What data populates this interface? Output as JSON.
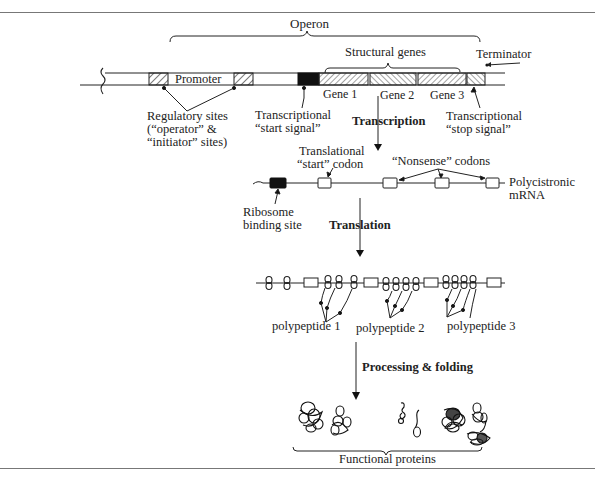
{
  "dna": {
    "operon_label": "Operon",
    "structural_genes_label": "Structural genes",
    "terminator_label": "Terminator",
    "promoter_label": "Promoter",
    "genes": [
      "Gene 1",
      "Gene 2",
      "Gene 3"
    ],
    "regulatory_sites_label": [
      "Regulatory sites",
      "(“operator” &",
      "“initiator” sites)"
    ],
    "transcriptional_start_label": [
      "Transcriptional",
      "“start signal”"
    ],
    "transcriptional_stop_label": [
      "Transcriptional",
      "“stop signal”"
    ]
  },
  "steps": {
    "transcription": "Transcription",
    "translation": "Translation",
    "processing": "Processing & folding"
  },
  "mrna": {
    "translational_start_label": [
      "Translational",
      "“start” codon"
    ],
    "nonsense_codons_label": "“Nonsense” codons",
    "polycistronic_label": [
      "Polycistronic",
      "mRNA"
    ],
    "ribosome_binding_label": [
      "Ribosome",
      "binding site"
    ]
  },
  "polypeptides": [
    "polypeptide 1",
    "polypeptide 2",
    "polypeptide 3"
  ],
  "proteins": {
    "label": "Functional proteins"
  },
  "colors": {
    "ink": "#1a1a1a",
    "frame": "#777777",
    "background": "#ffffff"
  }
}
